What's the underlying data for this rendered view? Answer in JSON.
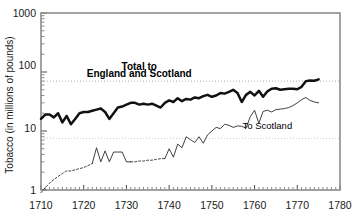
{
  "chart_data": {
    "type": "line",
    "title": "",
    "xlabel": "",
    "ylabel": "Tobacco (in millions of pounds)",
    "yscale": "log",
    "ylim": [
      1,
      1000
    ],
    "xlim": [
      1710,
      1780
    ],
    "grid": true,
    "gridlines_y": [
      70,
      7.5
    ],
    "legend_position": "inline-annotations",
    "y_tick_labels": [
      "1000",
      "100",
      "10",
      "1"
    ],
    "y_tick_values": [
      1000,
      100,
      10,
      1
    ],
    "x_tick_labels": [
      "1710",
      "1720",
      "1730",
      "1740",
      "1750",
      "1760",
      "1770",
      "1780"
    ],
    "x_tick_values": [
      1710,
      1720,
      1730,
      1740,
      1750,
      1760,
      1770,
      1780
    ],
    "x_minor_tick_step": 1,
    "annotations": [
      {
        "id": "total-annotation-line1",
        "text": "Total to",
        "x": 1733,
        "y": 110
      },
      {
        "id": "total-annotation-line2",
        "text": "England and Scotland",
        "x": 1733,
        "y": 82
      },
      {
        "id": "scotland-annotation",
        "text": "To Scotland",
        "x": 1763,
        "y": 11
      }
    ],
    "series": [
      {
        "name": "Total to England and Scotland",
        "style": "solid-thick",
        "x": [
          1710,
          1711,
          1712,
          1713,
          1714,
          1715,
          1716,
          1717,
          1718,
          1719,
          1720,
          1721,
          1722,
          1723,
          1724,
          1725,
          1726,
          1727,
          1728,
          1729,
          1730,
          1731,
          1732,
          1733,
          1734,
          1735,
          1736,
          1737,
          1738,
          1739,
          1740,
          1741,
          1742,
          1743,
          1744,
          1745,
          1746,
          1747,
          1748,
          1749,
          1750,
          1751,
          1752,
          1753,
          1754,
          1755,
          1756,
          1757,
          1758,
          1759,
          1760,
          1761,
          1762,
          1763,
          1764,
          1765,
          1766,
          1767,
          1768,
          1769,
          1770,
          1771,
          1772,
          1773,
          1774,
          1775
        ],
        "values": [
          16,
          19,
          19,
          17,
          20,
          14,
          18,
          13,
          16,
          20,
          21,
          21,
          22,
          23,
          24,
          21,
          16,
          20,
          25,
          26,
          28,
          30,
          30,
          28,
          29,
          28,
          29,
          27,
          25,
          30,
          33,
          31,
          36,
          32,
          35,
          34,
          37,
          36,
          39,
          41,
          38,
          40,
          44,
          43,
          46,
          50,
          44,
          31,
          41,
          46,
          40,
          48,
          38,
          47,
          52,
          53,
          50,
          51,
          52,
          52,
          51,
          56,
          70,
          72,
          71,
          75
        ]
      },
      {
        "name": "To Scotland",
        "style": "solid-thin-with-dashed-gaps",
        "x": [
          1710,
          1711,
          1712,
          1713,
          1714,
          1715,
          1716,
          1717,
          1718,
          1719,
          1720,
          1721,
          1722,
          1723,
          1724,
          1725,
          1726,
          1727,
          1728,
          1729,
          1730,
          1731,
          1732,
          1733,
          1734,
          1735,
          1736,
          1737,
          1738,
          1739,
          1740,
          1741,
          1742,
          1743,
          1744,
          1745,
          1746,
          1747,
          1748,
          1749,
          1750,
          1751,
          1752,
          1753,
          1754,
          1755,
          1756,
          1757,
          1758,
          1759,
          1760,
          1761,
          1762,
          1763,
          1764,
          1765,
          1766,
          1767,
          1768,
          1769,
          1770,
          1771,
          1772,
          1773,
          1774,
          1775
        ],
        "values": [
          0.9,
          1.1,
          1.3,
          1.5,
          1.7,
          1.9,
          2.1,
          2.1,
          2.2,
          2.3,
          2.4,
          2.6,
          2.8,
          5.2,
          3.0,
          4.6,
          3.0,
          4.4,
          4.4,
          4.4,
          3.0,
          3.0,
          3.0,
          3.1,
          3.1,
          3.2,
          3.2,
          3.3,
          3.4,
          3.4,
          5.0,
          3.6,
          6.0,
          5.2,
          8.0,
          7.1,
          6.4,
          8.0,
          6.2,
          8.6,
          10.0,
          11.5,
          11.0,
          13.0,
          12.5,
          11.5,
          12.2,
          12.0,
          11.2,
          17.5,
          22.5,
          13.5,
          21.5,
          22.5,
          21.0,
          23.0,
          23.5,
          24.0,
          25.0,
          27.0,
          30.0,
          34.0,
          37.0,
          33.0,
          31.0,
          30.0
        ],
        "dashed_ranges": [
          [
            1710,
            1722
          ],
          [
            1731,
            1739
          ]
        ]
      }
    ]
  },
  "axis": {
    "y_label": "Tobacco (in millions of pounds)"
  }
}
